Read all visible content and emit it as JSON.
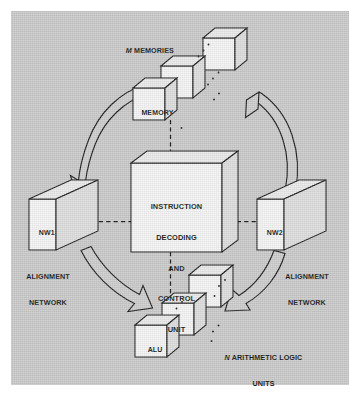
{
  "figure": {
    "panel_bg": "#c9c9c9",
    "line_color": "#1a1a1a",
    "face_color": "#f2f2f2",
    "side_color": "#dcdcdc",
    "top_color": "#e8e8e8"
  },
  "labels": {
    "memories": {
      "lead": "M",
      "rest": " MEMORIES"
    },
    "memory_cube": "MEMORY",
    "center_unit": "INSTRUCTION\nDECODING\nAND\nCONTROL\nUNIT",
    "center_unit_lines": [
      "INSTRUCTION",
      "DECODING",
      "AND",
      "CONTROL",
      "UNIT"
    ],
    "nw1_cube": "NW1",
    "nw2_cube": "NW2",
    "nw1_caption": "ALIGNMENT\nNETWORK",
    "nw1_caption_lines": [
      "ALIGNMENT",
      "NETWORK"
    ],
    "nw2_caption": "ALIGNMENT\nNETWORK",
    "nw2_caption_lines": [
      "ALIGNMENT",
      "NETWORK"
    ],
    "alu_cube": "ALU",
    "alus": {
      "lead": "N",
      "rest": " ARITHMETIC LOGIC"
    },
    "alus_line2": "UNITS"
  },
  "diagram": {
    "type": "block-diagram",
    "nodes": [
      {
        "id": "memories",
        "label": "M MEMORIES",
        "kind": "cube-stack",
        "count": 3,
        "position": "top"
      },
      {
        "id": "memory",
        "label": "MEMORY",
        "kind": "cube",
        "position": "top-front"
      },
      {
        "id": "control",
        "label": "INSTRUCTION DECODING AND CONTROL UNIT",
        "kind": "box3d",
        "position": "center"
      },
      {
        "id": "nw1",
        "label": "NW1",
        "kind": "box3d",
        "position": "left",
        "caption": "ALIGNMENT NETWORK"
      },
      {
        "id": "nw2",
        "label": "NW2",
        "kind": "box3d",
        "position": "right",
        "caption": "ALIGNMENT NETWORK"
      },
      {
        "id": "alus",
        "label": "N ARITHMETIC LOGIC UNITS",
        "kind": "cube-stack",
        "count": 3,
        "position": "bottom"
      },
      {
        "id": "alu",
        "label": "ALU",
        "kind": "cube",
        "position": "bottom-front"
      }
    ],
    "connections": [
      {
        "from": "memory",
        "to": "control",
        "style": "dashed",
        "orientation": "vertical"
      },
      {
        "from": "nw1",
        "to": "control",
        "style": "dashed",
        "orientation": "horizontal"
      },
      {
        "from": "control",
        "to": "nw2",
        "style": "dashed",
        "orientation": "horizontal"
      },
      {
        "from": "control",
        "to": "alu",
        "style": "dashed",
        "orientation": "vertical"
      },
      {
        "from": "memories",
        "to": "nw1",
        "style": "block-arrow",
        "direction": "counterclockwise"
      },
      {
        "from": "nw1",
        "to": "alus",
        "style": "block-arrow",
        "direction": "counterclockwise"
      },
      {
        "from": "alus",
        "to": "nw2",
        "style": "block-arrow",
        "direction": "counterclockwise"
      },
      {
        "from": "nw2",
        "to": "memories",
        "style": "block-arrow",
        "direction": "counterclockwise"
      }
    ]
  }
}
